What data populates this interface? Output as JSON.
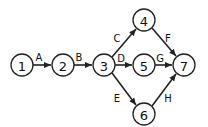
{
  "diagram": {
    "type": "activity-network",
    "nodes": [
      {
        "id": "1",
        "label": "1",
        "x": 22,
        "y": 65
      },
      {
        "id": "2",
        "label": "2",
        "x": 63,
        "y": 65
      },
      {
        "id": "3",
        "label": "3",
        "x": 104,
        "y": 65
      },
      {
        "id": "4",
        "label": "4",
        "x": 144,
        "y": 20
      },
      {
        "id": "5",
        "label": "5",
        "x": 144,
        "y": 65
      },
      {
        "id": "6",
        "label": "6",
        "x": 144,
        "y": 114
      },
      {
        "id": "7",
        "label": "7",
        "x": 184,
        "y": 65
      }
    ],
    "edges": [
      {
        "from": "1",
        "to": "2",
        "label": "A"
      },
      {
        "from": "2",
        "to": "3",
        "label": "B"
      },
      {
        "from": "3",
        "to": "4",
        "label": "C"
      },
      {
        "from": "3",
        "to": "5",
        "label": "D"
      },
      {
        "from": "3",
        "to": "6",
        "label": "E"
      },
      {
        "from": "4",
        "to": "7",
        "label": "F"
      },
      {
        "from": "5",
        "to": "7",
        "label": "G"
      },
      {
        "from": "6",
        "to": "7",
        "label": "H"
      }
    ]
  }
}
